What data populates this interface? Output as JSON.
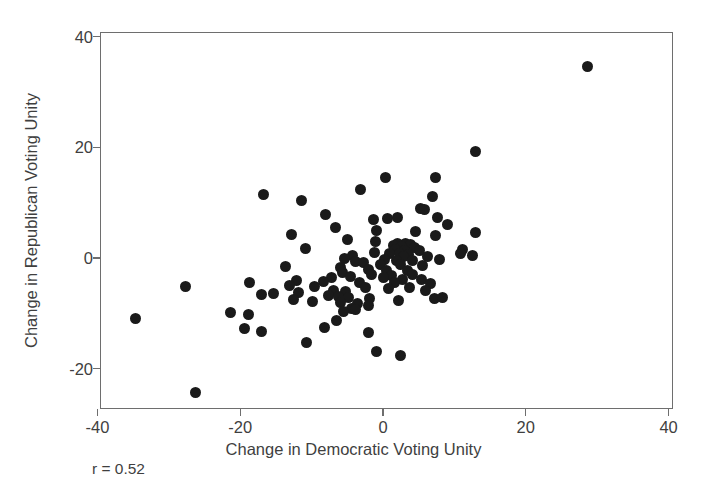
{
  "chart_data": {
    "type": "scatter",
    "title": "",
    "xlabel": "Change in Democratic Voting Unity",
    "ylabel": "Change in Republican Voting Unity",
    "xlim": [
      -40,
      40
    ],
    "ylim": [
      -26,
      41
    ],
    "xticks": [
      -40,
      -20,
      0,
      20,
      40
    ],
    "yticks": [
      -20,
      0,
      20,
      40
    ],
    "xticklabels": [
      "-40",
      "-20",
      "0",
      "20",
      "40"
    ],
    "yticklabels": [
      "-20",
      "0",
      "20",
      "40"
    ],
    "grid": false,
    "legend": null,
    "marker": "filled-circle",
    "marker_color": "#1a1a1a",
    "annotations": [
      {
        "text": "r = 0.52",
        "position": "below-axis-left"
      }
    ],
    "correlation": 0.52,
    "n_points": 113,
    "points": [
      [
        28.7,
        34.6
      ],
      [
        13.0,
        19.3
      ],
      [
        0.4,
        14.6
      ],
      [
        7.3,
        14.6
      ],
      [
        -3.1,
        12.3
      ],
      [
        -16.8,
        11.4
      ],
      [
        7.0,
        11.2
      ],
      [
        -11.4,
        10.4
      ],
      [
        5.2,
        8.9
      ],
      [
        5.8,
        8.7
      ],
      [
        -8.0,
        7.9
      ],
      [
        2.1,
        7.3
      ],
      [
        7.6,
        7.4
      ],
      [
        -1.3,
        7.0
      ],
      [
        0.6,
        7.2
      ],
      [
        9.1,
        6.1
      ],
      [
        -6.6,
        5.5
      ],
      [
        -0.9,
        5.0
      ],
      [
        4.6,
        4.8
      ],
      [
        12.9,
        4.6
      ],
      [
        -12.8,
        4.3
      ],
      [
        7.4,
        4.0
      ],
      [
        -5.0,
        3.3
      ],
      [
        -1.1,
        2.9
      ],
      [
        3.2,
        2.7
      ],
      [
        2.0,
        2.6
      ],
      [
        3.9,
        2.4
      ],
      [
        1.4,
        2.2
      ],
      [
        2.6,
        2.0
      ],
      [
        4.4,
        1.9
      ],
      [
        -10.9,
        1.8
      ],
      [
        1.8,
        1.5
      ],
      [
        3.0,
        1.4
      ],
      [
        5.1,
        1.3
      ],
      [
        11.1,
        1.5
      ],
      [
        -1.2,
        1.0
      ],
      [
        0.9,
        0.9
      ],
      [
        2.3,
        0.8
      ],
      [
        3.6,
        0.6
      ],
      [
        -4.3,
        0.4
      ],
      [
        2.9,
        0.2
      ],
      [
        6.2,
        0.2
      ],
      [
        12.6,
        0.4
      ],
      [
        -5.4,
        -0.1
      ],
      [
        0.2,
        -0.2
      ],
      [
        1.9,
        -0.4
      ],
      [
        4.1,
        -0.5
      ],
      [
        7.9,
        -0.2
      ],
      [
        -3.9,
        -0.6
      ],
      [
        -2.7,
        -0.9
      ],
      [
        -0.4,
        -1.1
      ],
      [
        2.4,
        -1.2
      ],
      [
        5.6,
        -1.3
      ],
      [
        -13.6,
        -1.5
      ],
      [
        -6.0,
        -1.7
      ],
      [
        -2.1,
        -2.0
      ],
      [
        0.5,
        -2.2
      ],
      [
        3.4,
        -2.3
      ],
      [
        -5.7,
        -2.6
      ],
      [
        -1.6,
        -2.9
      ],
      [
        1.2,
        -3.1
      ],
      [
        4.2,
        -3.0
      ],
      [
        -4.6,
        -3.3
      ],
      [
        -7.2,
        -3.5
      ],
      [
        0.1,
        -3.6
      ],
      [
        2.7,
        -3.8
      ],
      [
        5.4,
        -3.9
      ],
      [
        -12.1,
        -4.0
      ],
      [
        -8.4,
        -4.2
      ],
      [
        -3.3,
        -4.4
      ],
      [
        1.6,
        -4.5
      ],
      [
        6.7,
        -4.6
      ],
      [
        -18.7,
        -4.5
      ],
      [
        -13.1,
        -5.0
      ],
      [
        -9.6,
        -5.2
      ],
      [
        -2.4,
        -5.3
      ],
      [
        0.8,
        -5.5
      ],
      [
        3.7,
        -5.4
      ],
      [
        -27.6,
        -5.2
      ],
      [
        -6.9,
        -5.8
      ],
      [
        -5.2,
        -6.0
      ],
      [
        -11.8,
        -6.3
      ],
      [
        -15.4,
        -6.4
      ],
      [
        -17.0,
        -6.6
      ],
      [
        -7.6,
        -6.8
      ],
      [
        -6.3,
        -7.0
      ],
      [
        -4.8,
        -7.2
      ],
      [
        -1.9,
        -7.4
      ],
      [
        2.2,
        -7.6
      ],
      [
        7.2,
        -7.3
      ],
      [
        -12.5,
        -7.5
      ],
      [
        -9.9,
        -7.8
      ],
      [
        -5.9,
        -8.0
      ],
      [
        -3.6,
        -8.3
      ],
      [
        -2.0,
        -8.6
      ],
      [
        -4.4,
        -9.1
      ],
      [
        -3.8,
        -9.4
      ],
      [
        -5.5,
        -9.7
      ],
      [
        -21.3,
        -9.9
      ],
      [
        -18.9,
        -10.2
      ],
      [
        -34.6,
        -11.0
      ],
      [
        -6.5,
        -11.3
      ],
      [
        -19.4,
        -12.7
      ],
      [
        -8.2,
        -12.5
      ],
      [
        -17.0,
        -13.3
      ],
      [
        -2.1,
        -13.5
      ],
      [
        -10.7,
        -15.2
      ],
      [
        -0.9,
        -16.9
      ],
      [
        2.4,
        -17.6
      ],
      [
        -26.2,
        -24.4
      ],
      [
        8.4,
        -7.2
      ],
      [
        10.9,
        0.8
      ],
      [
        6.0,
        -5.9
      ]
    ]
  },
  "axes": {
    "x_title": "Change in Democratic Voting Unity",
    "y_title": "Change in Republican Voting Unity"
  },
  "annotation": {
    "correlation_text": "r = 0.52"
  }
}
